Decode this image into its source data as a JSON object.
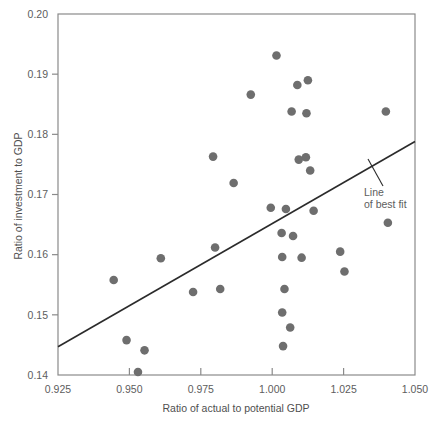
{
  "chart_data": {
    "type": "scatter",
    "title": "",
    "xlabel": "Ratio of actual to potential GDP",
    "ylabel": "Ratio of investment to GDP",
    "xlim": [
      0.925,
      1.05
    ],
    "ylim": [
      0.14,
      0.2
    ],
    "xticks": [
      0.925,
      0.95,
      0.975,
      1.0,
      1.025,
      1.05
    ],
    "xtick_labels": [
      "0.925",
      "0.950",
      "0.975",
      "1.000",
      "1.025",
      "1.050"
    ],
    "yticks": [
      0.14,
      0.15,
      0.16,
      0.17,
      0.18,
      0.19,
      0.2
    ],
    "ytick_labels": [
      "0.14",
      "0.15",
      "0.16",
      "0.17",
      "0.18",
      "0.19",
      "0.20"
    ],
    "grid": false,
    "legend": null,
    "marker_color": "#6e6e6e",
    "line_color": "#2b2b2b",
    "axis_color": "#8a8a8a",
    "points": [
      {
        "x": 0.9445,
        "y": 0.1558
      },
      {
        "x": 0.949,
        "y": 0.1458
      },
      {
        "x": 0.953,
        "y": 0.1405
      },
      {
        "x": 0.9553,
        "y": 0.1441
      },
      {
        "x": 0.961,
        "y": 0.1594
      },
      {
        "x": 0.9723,
        "y": 0.1538
      },
      {
        "x": 0.9793,
        "y": 0.1763
      },
      {
        "x": 0.98,
        "y": 0.1612
      },
      {
        "x": 0.9818,
        "y": 0.1543
      },
      {
        "x": 0.9865,
        "y": 0.1719
      },
      {
        "x": 0.9925,
        "y": 0.1866
      },
      {
        "x": 0.9995,
        "y": 0.1678
      },
      {
        "x": 1.0015,
        "y": 0.1931
      },
      {
        "x": 1.0033,
        "y": 0.1636
      },
      {
        "x": 1.0035,
        "y": 0.1596
      },
      {
        "x": 1.0035,
        "y": 0.1504
      },
      {
        "x": 1.0038,
        "y": 0.1448
      },
      {
        "x": 1.0043,
        "y": 0.1543
      },
      {
        "x": 1.0048,
        "y": 0.1676
      },
      {
        "x": 1.0063,
        "y": 0.1479
      },
      {
        "x": 1.0068,
        "y": 0.1838
      },
      {
        "x": 1.0073,
        "y": 0.1631
      },
      {
        "x": 1.0088,
        "y": 0.1882
      },
      {
        "x": 1.0093,
        "y": 0.1758
      },
      {
        "x": 1.0103,
        "y": 0.1595
      },
      {
        "x": 1.0118,
        "y": 0.1762
      },
      {
        "x": 1.012,
        "y": 0.1835
      },
      {
        "x": 1.0125,
        "y": 0.189
      },
      {
        "x": 1.0133,
        "y": 0.174
      },
      {
        "x": 1.0145,
        "y": 0.1673
      },
      {
        "x": 1.0238,
        "y": 0.1605
      },
      {
        "x": 1.0253,
        "y": 0.1572
      },
      {
        "x": 1.0398,
        "y": 0.1838
      },
      {
        "x": 1.0405,
        "y": 0.1653
      }
    ],
    "best_fit_line": {
      "label_line1": "Line",
      "label_line2": "of best fit",
      "x_start": 0.925,
      "y_start": 0.1447,
      "x_end": 1.05,
      "y_end": 0.1788
    }
  }
}
